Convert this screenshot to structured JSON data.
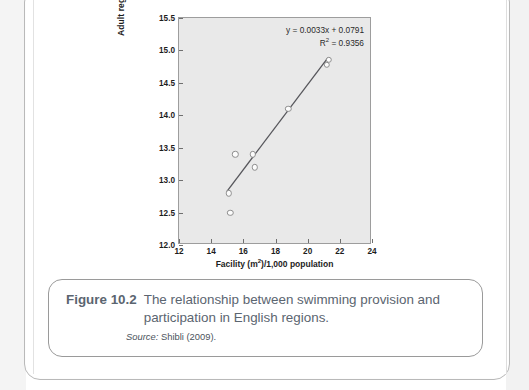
{
  "figure": {
    "caption_number": "Figure 10.2",
    "caption_text": "The relationship between swimming provision and participation in English regions.",
    "source_label": "Source:",
    "source_text": "Shibli (2009)."
  },
  "chart_data": {
    "type": "scatter",
    "title": "",
    "xlabel": "Facility (m²)/1,000 population",
    "ylabel": "Adult regular participation rate (%)",
    "xlim": [
      12,
      24
    ],
    "ylim": [
      12.0,
      15.5
    ],
    "xticks": [
      12,
      14,
      16,
      18,
      20,
      22,
      24
    ],
    "yticks": [
      "12.0",
      "12.5",
      "13.0",
      "13.5",
      "14.0",
      "14.5",
      "15.0",
      "15.5"
    ],
    "grid": false,
    "legend": "none",
    "plot_background": "#e9e9e9",
    "marker_fill": "#fcfcfc",
    "marker_edge": "#8e8e8e",
    "trendline_color": "#55555a",
    "points": [
      {
        "x": 15.1,
        "y": 12.8
      },
      {
        "x": 15.2,
        "y": 12.5
      },
      {
        "x": 15.5,
        "y": 13.4
      },
      {
        "x": 16.6,
        "y": 13.4
      },
      {
        "x": 16.7,
        "y": 13.2
      },
      {
        "x": 18.8,
        "y": 14.1
      },
      {
        "x": 21.2,
        "y": 14.78
      },
      {
        "x": 21.3,
        "y": 14.86
      }
    ],
    "trendline": {
      "x_start": 15.0,
      "y_start": 12.8,
      "x_end": 21.35,
      "y_end": 14.88
    },
    "annotations": {
      "equation": "y = 0.0033x + 0.0791",
      "r_squared_label": "R",
      "r_squared_exponent": "2",
      "r_squared_value": " = 0.9356"
    }
  }
}
